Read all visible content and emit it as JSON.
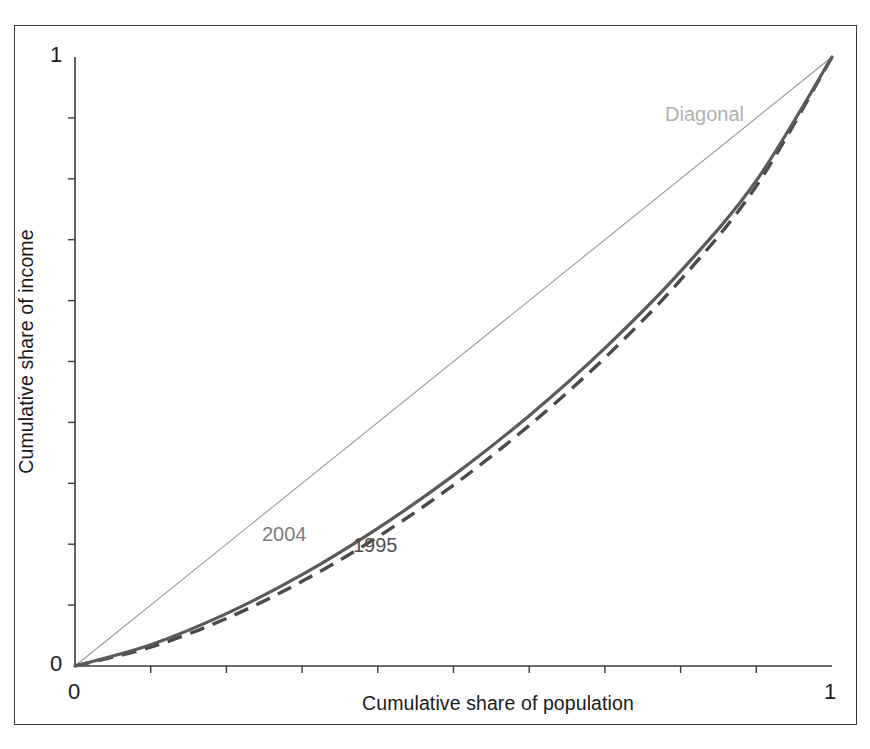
{
  "figure": {
    "background_color": "#ffffff",
    "frame_color": "#3a3a3a"
  },
  "axes": {
    "x_label": "Cumulative share of population",
    "y_label": "Cumulative share of income",
    "x_tick_labels": [
      "0",
      "1"
    ],
    "y_tick_labels": [
      "0",
      "1"
    ],
    "x_min_label": "0",
    "x_max_label": "1",
    "y_min_label": "0",
    "y_max_label": "1",
    "axis_color": "#3a3a3a",
    "minor_tick_count": 9
  },
  "annotations": {
    "diagonal": "Diagonal",
    "series_2004": "2004",
    "series_1995": "1995"
  },
  "chart_data": {
    "type": "line",
    "title": "",
    "subtitle": "",
    "xlabel": "Cumulative share of population",
    "ylabel": "Cumulative share of income",
    "xlim": [
      0,
      1
    ],
    "ylim": [
      0,
      1
    ],
    "grid": false,
    "legend": "inline-annotations",
    "annotations": [
      {
        "text": "Diagonal",
        "x": 0.79,
        "y": 0.885,
        "color": "#b0b0b0"
      },
      {
        "text": "2004",
        "x": 0.255,
        "y": 0.215,
        "color": "#7d7d7d"
      },
      {
        "text": "1995",
        "x": 0.375,
        "y": 0.198,
        "color": "#4f4f4f"
      }
    ],
    "x": [
      0,
      0.1,
      0.2,
      0.3,
      0.4,
      0.5,
      0.6,
      0.7,
      0.8,
      0.9,
      1.0
    ],
    "series": [
      {
        "name": "Diagonal",
        "style": "solid-thin",
        "color": "#9a9a9a",
        "width": 1.1,
        "values": [
          0,
          0.1,
          0.2,
          0.3,
          0.4,
          0.5,
          0.6,
          0.7,
          0.8,
          0.9,
          1.0
        ]
      },
      {
        "name": "2004",
        "style": "solid",
        "color": "#5a5a5a",
        "width": 3.2,
        "values": [
          0,
          0.035,
          0.086,
          0.15,
          0.226,
          0.313,
          0.411,
          0.522,
          0.648,
          0.797,
          1.0
        ]
      },
      {
        "name": "1995",
        "style": "dashed",
        "color": "#4a4a4a",
        "width": 3.4,
        "values": [
          0,
          0.031,
          0.078,
          0.139,
          0.212,
          0.297,
          0.395,
          0.506,
          0.634,
          0.788,
          1.0
        ]
      }
    ]
  }
}
